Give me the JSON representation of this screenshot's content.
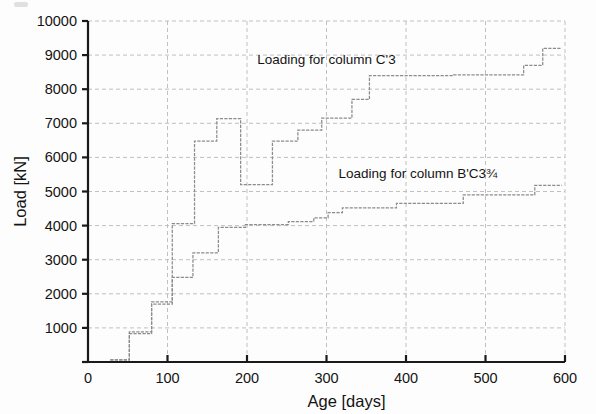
{
  "figure": {
    "background": "#fdfdfd",
    "axis_color": "#1a1a1a",
    "grid_color": "#b9b9b9",
    "series_color": "#8c8c8c",
    "text_color": "#141414"
  },
  "chart_data": {
    "type": "line",
    "title": "",
    "xlabel": "Age [days]",
    "ylabel": "Load [kN]",
    "xlim": [
      0,
      600
    ],
    "ylim": [
      0,
      10000
    ],
    "xticks": [
      0,
      100,
      200,
      300,
      400,
      500,
      600
    ],
    "xticklabels": [
      "0",
      "100",
      "200",
      "300",
      "400",
      "500",
      "600"
    ],
    "yticks": [
      0,
      1000,
      2000,
      3000,
      4000,
      5000,
      6000,
      7000,
      8000,
      9000,
      10000
    ],
    "yticklabels": [
      "",
      "1000",
      "2000",
      "3000",
      "4000",
      "5000",
      "6000",
      "7000",
      "8000",
      "9000",
      "10000"
    ],
    "grid": true,
    "grid_style": "dashed",
    "legend": "none",
    "drawstyle": "steps-post",
    "annotations": [
      {
        "name": "upper-curve-label",
        "text": "Loading for column C'3",
        "x": 300,
        "y": 8750
      },
      {
        "name": "lower-curve-label",
        "text": "Loading for column B'C3¾",
        "x": 415,
        "y": 5400
      }
    ],
    "series": [
      {
        "name": "Loading for column C'3",
        "label": "Loading for column C'3",
        "x": [
          28,
          50,
          52,
          78,
          80,
          104,
          106,
          130,
          132,
          134,
          160,
          162,
          190,
          192,
          230,
          232,
          262,
          264,
          292,
          294,
          300,
          330,
          332,
          352,
          354,
          458,
          460,
          545,
          548,
          568,
          572,
          596
        ],
        "y": [
          60,
          60,
          830,
          830,
          1700,
          1700,
          4060,
          4060,
          4060,
          6480,
          6480,
          7140,
          7140,
          5200,
          5200,
          6480,
          6480,
          6800,
          6800,
          7150,
          7150,
          7150,
          7700,
          7700,
          8400,
          8400,
          8420,
          8420,
          8700,
          8700,
          9200,
          9200
        ]
      },
      {
        "name": "Loading for column B'C3¾",
        "label": "Loading for column B'C3¾",
        "x": [
          28,
          50,
          52,
          78,
          80,
          104,
          106,
          130,
          132,
          162,
          164,
          196,
          198,
          250,
          252,
          282,
          284,
          300,
          302,
          318,
          320,
          386,
          388,
          470,
          472,
          500,
          502,
          560,
          562,
          596
        ],
        "y": [
          60,
          60,
          880,
          880,
          1760,
          1760,
          2480,
          2480,
          3200,
          3200,
          3950,
          3950,
          4030,
          4030,
          4120,
          4120,
          4230,
          4230,
          4380,
          4380,
          4520,
          4520,
          4650,
          4650,
          4900,
          4900,
          4900,
          4900,
          5180,
          5180
        ]
      }
    ]
  }
}
